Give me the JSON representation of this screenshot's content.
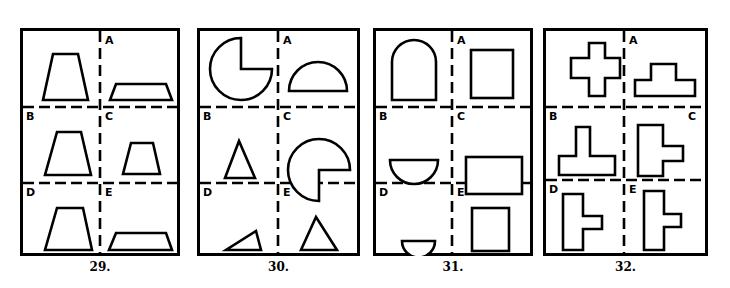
{
  "page": {
    "background": "#ffffff",
    "ink": "#000000"
  },
  "puzzles": [
    {
      "number": "29.",
      "cell_labels": [
        "A",
        "B",
        "C",
        "D",
        "E"
      ],
      "shapes": {
        "sample": "tall-trapezoid",
        "A": "wide-flat-trapezoid",
        "B": "medium-trapezoid",
        "C": "small-trapezoid",
        "D": "medium-trapezoid",
        "E": "wide-flat-trapezoid"
      }
    },
    {
      "number": "30.",
      "cell_labels": [
        "A",
        "B",
        "C",
        "D",
        "E"
      ],
      "shapes": {
        "sample": "pac-man-circle-notch-lower-right",
        "A": "half-disc-flat-down",
        "B": "triangle",
        "C": "pac-man-circle-notch-upper-right",
        "D": "thin-right-triangle",
        "E": "triangle"
      }
    },
    {
      "number": "31.",
      "cell_labels": [
        "A",
        "B",
        "C",
        "D",
        "E"
      ],
      "shapes": {
        "sample": "arch-rounded-top",
        "A": "square",
        "B": "half-disc-flat-up",
        "C": "wide-rectangle",
        "D": "small-half-disc-flat-up",
        "E": "tall-rectangle"
      }
    },
    {
      "number": "32.",
      "cell_labels": [
        "A",
        "B",
        "C",
        "D",
        "E"
      ],
      "shapes": {
        "sample": "plus-cross",
        "A": "tee-wide-stem-up",
        "B": "tee-narrow-stem-up",
        "C": "vertical-bar-with-right-nub",
        "D": "vertical-bar-with-right-nub-small",
        "E": "vertical-bar-with-right-nub-small"
      }
    }
  ]
}
